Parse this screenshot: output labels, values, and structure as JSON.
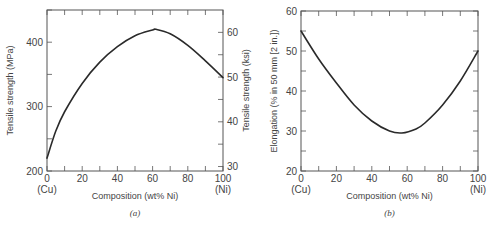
{
  "chart_data": [
    {
      "type": "line",
      "panel": "(a)",
      "xlabel": "Composition (wt% Ni)",
      "ylabel": "Tensile strength (MPa)",
      "ylabel_right": "Tensile strength (ksi)",
      "xlim": [
        0,
        100
      ],
      "ylim": [
        200,
        450
      ],
      "ylim_right_ksi": [
        29,
        65
      ],
      "x_ticks": [
        "0",
        "20",
        "40",
        "60",
        "80",
        "100"
      ],
      "x_tick_sublabels": {
        "0": "(Cu)",
        "100": "(Ni)"
      },
      "y_ticks": [
        "200",
        "300",
        "400"
      ],
      "y_ticks_right": [
        "30",
        "40",
        "50",
        "60"
      ],
      "grid": false,
      "x": [
        0,
        5,
        10,
        20,
        30,
        40,
        50,
        60,
        62,
        70,
        80,
        90,
        100
      ],
      "series": [
        {
          "name": "Tensile strength",
          "values": [
            220,
            262,
            292,
            336,
            369,
            393,
            410,
            419,
            420,
            413,
            395,
            371,
            345
          ]
        }
      ]
    },
    {
      "type": "line",
      "panel": "(b)",
      "xlabel": "Composition (wt% Ni)",
      "ylabel": "Elongation (% in 50 mm [2 in.])",
      "xlim": [
        0,
        100
      ],
      "ylim": [
        20,
        60
      ],
      "x_ticks": [
        "0",
        "20",
        "40",
        "60",
        "80",
        "100"
      ],
      "x_tick_sublabels": {
        "0": "(Cu)",
        "100": "(Ni)"
      },
      "y_ticks": [
        "20",
        "30",
        "40",
        "50",
        "60"
      ],
      "grid": false,
      "x": [
        0,
        10,
        20,
        30,
        40,
        50,
        57,
        65,
        70,
        80,
        90,
        100
      ],
      "series": [
        {
          "name": "Elongation",
          "values": [
            55,
            48,
            42,
            36.5,
            32.5,
            30,
            29.5,
            30.5,
            32,
            36.5,
            42.5,
            50
          ]
        }
      ]
    }
  ],
  "captions": {
    "a": "(a)",
    "b": "(b)"
  },
  "labels": {
    "a_ylabel": "Tensile strength (MPa)",
    "a_ylabel_right": "Tensile strength (ksi)",
    "a_xlabel": "Composition (wt% Ni)",
    "b_ylabel": "Elongation (% in 50 mm [2 in.])",
    "b_xlabel": "Composition (wt% Ni)",
    "cu": "(Cu)",
    "ni": "(Ni)"
  }
}
